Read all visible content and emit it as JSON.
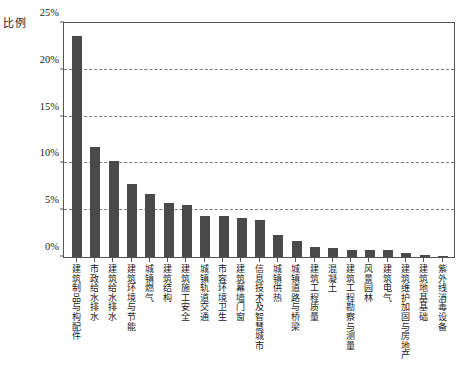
{
  "chart_data": {
    "type": "bar",
    "title": "",
    "subtitle": "",
    "ylabel": "比例",
    "xlabel": "",
    "ylim": [
      0,
      25
    ],
    "ytick_labels": [
      "0%",
      "5%",
      "10%",
      "15%",
      "20%",
      "25%"
    ],
    "ytick_values": [
      0,
      5,
      10,
      15,
      20,
      25
    ],
    "grid": true,
    "gridlines_at": [
      5,
      10,
      15,
      20
    ],
    "legend": null,
    "bar_color": "#4a4a4a",
    "axis_color": "#555555",
    "unit": "%",
    "categories": [
      "建筑制品与构配件",
      "市政给水排水",
      "建筑给水排水",
      "建筑环境与节能",
      "城镇燃气",
      "建筑结构",
      "建筑施工安全",
      "城镇轨道交通",
      "市容环境卫生",
      "建筑幕墙门窗",
      "信息技术及智慧城市",
      "城镇供热",
      "城镇道路与桥梁",
      "建筑工程质量",
      "混凝土",
      "建筑工程勘察与测量",
      "风景园林",
      "建筑电气",
      "建筑维护加固与房地产",
      "建筑地基基础",
      "紫外线消毒设备"
    ],
    "values": [
      23.6,
      11.8,
      10.3,
      7.8,
      6.7,
      5.8,
      5.6,
      4.4,
      4.4,
      4.2,
      4.0,
      2.3,
      1.7,
      1.1,
      1.0,
      0.8,
      0.7,
      0.7,
      0.4,
      0.2,
      0.15
    ]
  }
}
